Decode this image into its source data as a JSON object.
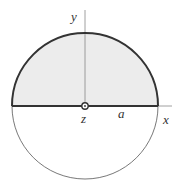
{
  "diagram": {
    "labels": {
      "y_axis": "y",
      "x_axis": "x",
      "z_axis": "z",
      "radius": "a"
    },
    "colors": {
      "shaded_region": "#ececec",
      "outline": "#333333",
      "axis": "#888888"
    }
  }
}
